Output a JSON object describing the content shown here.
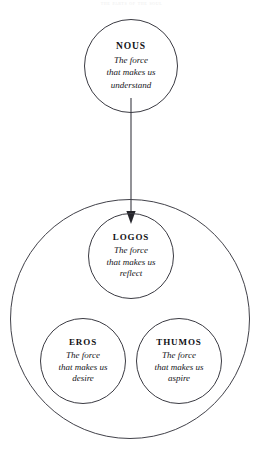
{
  "header": {
    "caption": "the parts of the soul"
  },
  "diagram": {
    "type": "nested-circles",
    "background_color": "#ffffff",
    "stroke_color": "#3a3a42",
    "text_color": "#15151a",
    "nodes": [
      {
        "id": "nous",
        "title": "NOUS",
        "description": "The force\nthat makes us\nunderstand",
        "container": "none"
      },
      {
        "id": "logos",
        "title": "LOGOS",
        "description": "The force\nthat makes us\nreflect",
        "container": "soul"
      },
      {
        "id": "eros",
        "title": "EROS",
        "description": "The force\nthat makes us\ndesire",
        "container": "soul"
      },
      {
        "id": "thumos",
        "title": "THUMOS",
        "description": "The force\nthat makes us\naspire",
        "container": "soul"
      }
    ],
    "connectors": [
      {
        "id": "nous-to-logos",
        "from": "nous",
        "to": "logos",
        "style": "solid-arrow",
        "direction": "down"
      }
    ]
  }
}
